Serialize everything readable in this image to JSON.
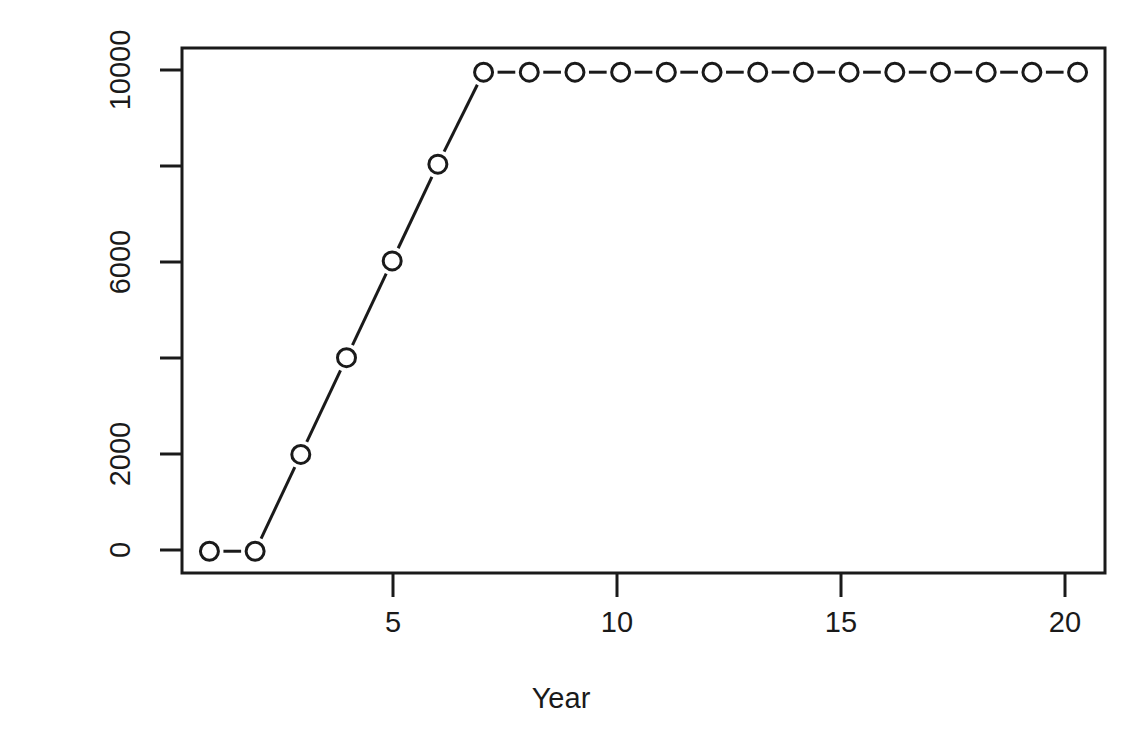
{
  "chart_data": {
    "type": "line",
    "title": "",
    "xlabel": "Year",
    "ylabel": "Sales [000 lbs]",
    "xlim": [
      0.4,
      20.6
    ],
    "ylim": [
      -450,
      10400
    ],
    "grid": false,
    "legend": null,
    "marker": "open-circle",
    "linestyle": "solid",
    "x": [
      1,
      2,
      3,
      4,
      5,
      6,
      7,
      8,
      9,
      10,
      11,
      12,
      13,
      14,
      15,
      16,
      17,
      18,
      19,
      20
    ],
    "values": [
      0,
      0,
      2000,
      4000,
      6000,
      8000,
      9900,
      9900,
      9900,
      9900,
      9900,
      9900,
      9900,
      9900,
      9900,
      9900,
      9900,
      9900,
      9900,
      9900
    ],
    "xticks": [
      5,
      10,
      15,
      20
    ],
    "xticklabels": [
      "5",
      "10",
      "15",
      "20"
    ],
    "yticks": [
      0,
      2000,
      4000,
      6000,
      8000,
      10000
    ],
    "yticklabels": [
      "0",
      "2000",
      "",
      "6000",
      "",
      "10000"
    ],
    "series": [
      {
        "name": "Sales",
        "values": [
          0,
          0,
          2000,
          4000,
          6000,
          8000,
          9900,
          9900,
          9900,
          9900,
          9900,
          9900,
          9900,
          9900,
          9900,
          9900,
          9900,
          9900,
          9900,
          9900
        ]
      }
    ],
    "colors": {
      "line": "#1a1a1a",
      "marker": "#1a1a1a",
      "axis": "#1a1a1a",
      "background": "#ffffff"
    }
  },
  "axes": {
    "x_title": "Year",
    "y_title": "Sales [000 lbs]"
  }
}
